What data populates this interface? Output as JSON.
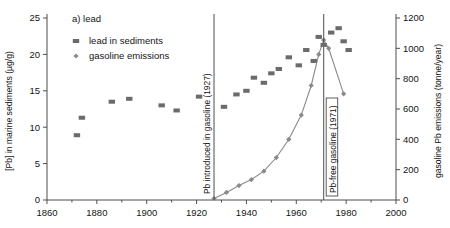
{
  "figure": {
    "panel_label": "a) lead",
    "background": "#ffffff",
    "ink_color": "#4d4d4d"
  },
  "legend": {
    "position": "top-left-inside",
    "entries": [
      {
        "label": "lead in sediments",
        "marker": "square",
        "color": "#6b6b6b"
      },
      {
        "label": "gasoline emissions",
        "marker": "diamond",
        "color": "#8a8a8a"
      }
    ]
  },
  "annotations": [
    {
      "name": "pb-introduced",
      "text": "Pb introduced in gasoline (1927)",
      "year": 1927,
      "boxed": false
    },
    {
      "name": "pb-free",
      "text": "Pb-free gasoline (1971)",
      "year": 1971,
      "boxed": true
    }
  ],
  "chart_data": {
    "type": "scatter",
    "title": "a) lead",
    "xlabel": "",
    "xlim": [
      1860,
      2000
    ],
    "xticks": [
      1860,
      1880,
      1900,
      1920,
      1940,
      1960,
      1980,
      2000
    ],
    "xminorticks": [
      1870,
      1890,
      1910,
      1930,
      1950,
      1970,
      1990
    ],
    "grid": false,
    "legend_position": "upper left",
    "axes": [
      {
        "side": "left",
        "ylabel": "[Pb] in marine sediments (µg/g)",
        "ylim": [
          0,
          25
        ],
        "yticks": [
          0,
          5,
          10,
          15,
          20,
          25
        ]
      },
      {
        "side": "right",
        "ylabel": "gasoline Pb emissions (tonne/year)",
        "ylim": [
          0,
          1200
        ],
        "yticks": [
          0,
          200,
          400,
          600,
          800,
          1000,
          1200
        ]
      }
    ],
    "series": [
      {
        "name": "lead in sediments",
        "marker": "square",
        "color": "#6b6b6b",
        "axis": "left",
        "units": "µg/g",
        "points": [
          {
            "x": 1872,
            "y": 8.9
          },
          {
            "x": 1874,
            "y": 11.3
          },
          {
            "x": 1886,
            "y": 13.5
          },
          {
            "x": 1893,
            "y": 13.9
          },
          {
            "x": 1906,
            "y": 13.0
          },
          {
            "x": 1912,
            "y": 12.3
          },
          {
            "x": 1921,
            "y": 14.2
          },
          {
            "x": 1931,
            "y": 12.8
          },
          {
            "x": 1936,
            "y": 14.5
          },
          {
            "x": 1940,
            "y": 15.0
          },
          {
            "x": 1943,
            "y": 16.8
          },
          {
            "x": 1947,
            "y": 16.1
          },
          {
            "x": 1950,
            "y": 17.4
          },
          {
            "x": 1953,
            "y": 18.0
          },
          {
            "x": 1957,
            "y": 19.6
          },
          {
            "x": 1961,
            "y": 18.5
          },
          {
            "x": 1964,
            "y": 20.6
          },
          {
            "x": 1967,
            "y": 19.1
          },
          {
            "x": 1969,
            "y": 22.4
          },
          {
            "x": 1971,
            "y": 21.3
          },
          {
            "x": 1974,
            "y": 23.0
          },
          {
            "x": 1977,
            "y": 23.6
          },
          {
            "x": 1979,
            "y": 21.8
          },
          {
            "x": 1981,
            "y": 20.6
          }
        ]
      },
      {
        "name": "gasoline emissions",
        "marker": "diamond",
        "color": "#8a8a8a",
        "axis": "right",
        "units": "tonne/year",
        "points": [
          {
            "x": 1927,
            "y": 10
          },
          {
            "x": 1932,
            "y": 50
          },
          {
            "x": 1937,
            "y": 95
          },
          {
            "x": 1942,
            "y": 135
          },
          {
            "x": 1947,
            "y": 190
          },
          {
            "x": 1952,
            "y": 280
          },
          {
            "x": 1957,
            "y": 400
          },
          {
            "x": 1962,
            "y": 560
          },
          {
            "x": 1966,
            "y": 755
          },
          {
            "x": 1969,
            "y": 960
          },
          {
            "x": 1971,
            "y": 1055
          },
          {
            "x": 1973,
            "y": 1000
          },
          {
            "x": 1979,
            "y": 700
          }
        ]
      }
    ]
  }
}
